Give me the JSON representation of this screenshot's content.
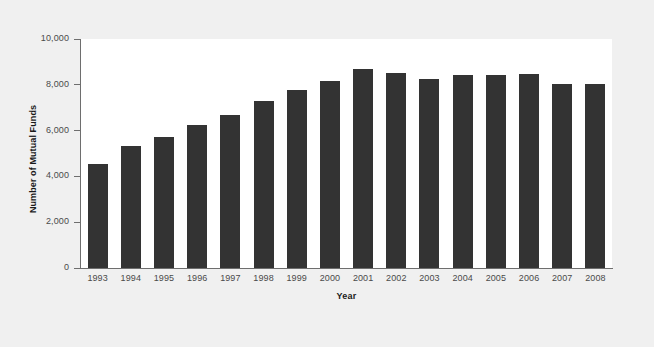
{
  "chart_data": {
    "type": "bar",
    "title": "",
    "xlabel": "Year",
    "ylabel": "Number of Mutual Funds",
    "categories": [
      "1993",
      "1994",
      "1995",
      "1996",
      "1997",
      "1998",
      "1999",
      "2000",
      "2001",
      "2002",
      "2003",
      "2004",
      "2005",
      "2006",
      "2007",
      "2008"
    ],
    "values": [
      4558,
      5330,
      5725,
      6248,
      6684,
      7314,
      7791,
      8155,
      8693,
      8511,
      8244,
      8417,
      8449,
      8454,
      8026,
      8022
    ],
    "ylim": [
      0,
      10000
    ],
    "ytick_values": [
      0,
      2000,
      4000,
      6000,
      8000,
      10000
    ],
    "ytick_labels": [
      "0",
      "2,000",
      "4,000",
      "6,000",
      "8,000",
      "10,000"
    ],
    "grid": false,
    "legend": null,
    "bar_color": "#333333",
    "plot_background": "#ffffff",
    "figure_background": "#f0f0f0",
    "axis_color": "#6e6e6e",
    "tick_label_color": "#4a4a4a",
    "axis_title_color": "#1a1a1a"
  }
}
